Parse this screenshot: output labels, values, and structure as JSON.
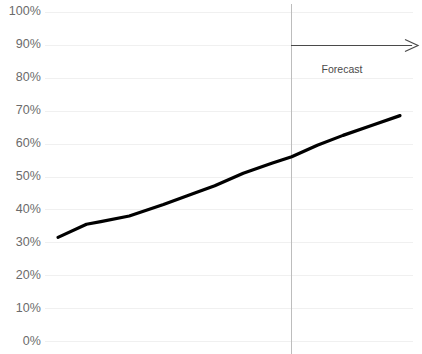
{
  "chart_data": {
    "type": "line",
    "title": "",
    "xlabel": "",
    "ylabel": "",
    "ylim": [
      0,
      100
    ],
    "grid": true,
    "legend": false,
    "y_tick_labels": [
      "100%",
      "90%",
      "80%",
      "70%",
      "60%",
      "50%",
      "40%",
      "30%",
      "20%",
      "10%",
      "0%"
    ],
    "y_tick_values": [
      100,
      90,
      80,
      70,
      60,
      50,
      40,
      30,
      20,
      10,
      0
    ],
    "x_tick_labels": [],
    "series": [
      {
        "name": "trend",
        "color": "#000000",
        "points": [
          {
            "x": 0,
            "y": 31.5
          },
          {
            "x": 10,
            "y": 35.5
          },
          {
            "x": 15,
            "y": 36.3
          },
          {
            "x": 25,
            "y": 38.0
          },
          {
            "x": 37,
            "y": 41.5
          },
          {
            "x": 48,
            "y": 45.0
          },
          {
            "x": 55,
            "y": 47.2
          },
          {
            "x": 65,
            "y": 51.0
          },
          {
            "x": 75,
            "y": 54.0
          },
          {
            "x": 82,
            "y": 56.0
          },
          {
            "x": 91,
            "y": 59.5
          },
          {
            "x": 100,
            "y": 62.5
          },
          {
            "x": 110,
            "y": 65.5
          },
          {
            "x": 120,
            "y": 68.5
          }
        ]
      }
    ],
    "annotations": [
      {
        "name": "forecast-divider",
        "type": "vertical-line",
        "x": 82,
        "color": "#bdbdbd"
      },
      {
        "name": "forecast-arrow",
        "type": "arrow",
        "direction": "right",
        "color": "#4a4a4a"
      },
      {
        "name": "forecast-label",
        "type": "text",
        "text": "Forecast",
        "color": "#4a4a4a"
      }
    ],
    "colors": {
      "line": "#000000",
      "gridline": "#f0f0f0",
      "divider": "#bdbdbd",
      "tick_label": "#6b6b6b",
      "annotation": "#4a4a4a",
      "background": "#ffffff"
    }
  },
  "annotation_text": {
    "forecast": "Forecast"
  }
}
